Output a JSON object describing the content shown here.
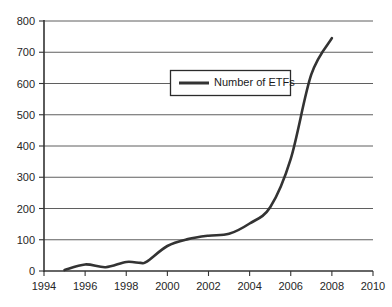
{
  "chart_data": {
    "type": "line",
    "title": "",
    "subtitle": "",
    "xlabel": "",
    "ylabel": "",
    "xlim": [
      1994,
      2010
    ],
    "ylim": [
      0,
      800
    ],
    "grid": "horizontal",
    "legend_position": "inside-top-center",
    "x_tick_labels": [
      "1994",
      "1996",
      "1998",
      "2000",
      "2002",
      "2004",
      "2006",
      "2008",
      "2010"
    ],
    "x_ticks": [
      1994,
      1996,
      1998,
      2000,
      2002,
      2004,
      2006,
      2008,
      2010
    ],
    "y_tick_labels": [
      "0",
      "100",
      "200",
      "300",
      "400",
      "500",
      "600",
      "700",
      "800"
    ],
    "y_ticks": [
      0,
      100,
      200,
      300,
      400,
      500,
      600,
      700,
      800
    ],
    "series": [
      {
        "name": "Number of ETFs",
        "color": "#333333",
        "x": [
          1995,
          1996,
          1997,
          1998,
          1998.7,
          1999,
          2000,
          2001,
          2002,
          2003,
          2004,
          2005,
          2006,
          2007,
          2008
        ],
        "values": [
          3,
          21,
          12,
          29,
          26,
          30,
          80,
          102,
          113,
          119,
          152,
          204,
          359,
          629,
          745
        ]
      }
    ]
  },
  "legend": {
    "entries": [
      {
        "label": "Number of ETFs"
      }
    ]
  },
  "axes": {
    "y_axis_name": "value-axis",
    "x_axis_name": "year-axis"
  }
}
